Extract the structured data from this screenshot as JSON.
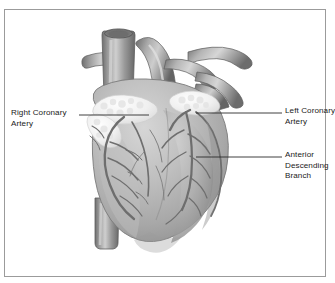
{
  "figure": {
    "background_color": "#ffffff",
    "border_color": "#9b9b9b",
    "heart_color": "#b8b8b8",
    "vessel_color": "#8f8f8f",
    "fat_color": "#f4f4f4",
    "leader_color": "#2b2b2b",
    "text_color": "#1a1a1a"
  },
  "labels": {
    "right_coronary_artery": "Right Coronary\nArtery",
    "left_coronary_artery": "Left Coronary\nArtery",
    "anterior_descending_branch": "Anterior\nDescending\nBranch"
  },
  "structures": [
    "superior-vena-cava",
    "aorta",
    "pulmonary-artery",
    "pulmonary-veins",
    "right-atrium",
    "right-ventricle",
    "left-ventricle",
    "inferior-vena-cava",
    "epicardial-fat",
    "coronary-arteries"
  ]
}
